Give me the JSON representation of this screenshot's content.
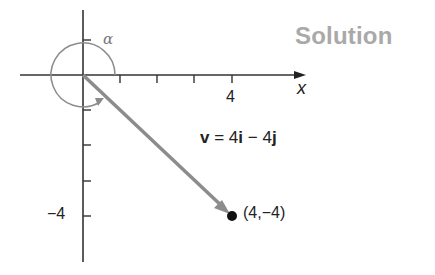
{
  "title": "Solution",
  "diagram": {
    "x_axis_label": "x",
    "x_tick_label": "4",
    "y_tick_label": "−4",
    "angle_label": "α",
    "vector_name": "v",
    "equation": {
      "lhs": "v",
      "eq": " = 4",
      "i": "i",
      "minus": " − 4",
      "j": "j"
    },
    "point_label": "(4,−4)",
    "point": {
      "x": 4,
      "y": -4
    },
    "colors": {
      "axis": "#333333",
      "vector": "#8c8c8c",
      "angle_arc": "#8c8c8c",
      "title": "#a9a9a9",
      "point": "#111111"
    }
  }
}
